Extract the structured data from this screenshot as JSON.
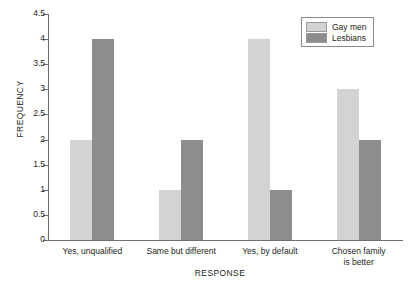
{
  "chart_data": {
    "type": "bar",
    "title": "",
    "xlabel": "RESPONSE",
    "ylabel": "FREQUENCY",
    "categories": [
      "Yes, unqualified",
      "Same but different",
      "Yes, by default",
      "Chosen family\nis better"
    ],
    "series": [
      {
        "name": "Gay men",
        "color": "#d3d3d3",
        "values": [
          2,
          1,
          4,
          3
        ]
      },
      {
        "name": "Lesbians",
        "color": "#8d8d8d",
        "values": [
          4,
          2,
          1,
          2
        ]
      }
    ],
    "ylim": [
      0,
      4.5
    ],
    "yticks": [
      0,
      0.5,
      1,
      1.5,
      2,
      2.5,
      3,
      3.5,
      4,
      4.5
    ],
    "ytick_labels": [
      "0",
      "0.5",
      "1",
      "1.5",
      "2",
      "2.5",
      "3",
      "3.5",
      "4",
      "4.5"
    ],
    "grid": false,
    "legend_position": "top-right"
  },
  "category_lines": [
    [
      "Yes, unqualified"
    ],
    [
      "Same but different"
    ],
    [
      "Yes, by default"
    ],
    [
      "Chosen family",
      "is better"
    ]
  ]
}
